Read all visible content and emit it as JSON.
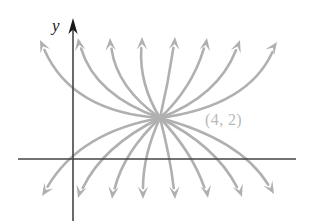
{
  "figure": {
    "kind": "phase-portrait",
    "background_color": "#ffffff",
    "width": 315,
    "height": 221
  },
  "axes": {
    "color": "#454545",
    "y_axis_label": "y",
    "x_axis_label": "",
    "origin": {
      "x": 73,
      "y": 159
    },
    "x_axis": {
      "x1": 18,
      "y1": 159,
      "x2": 296,
      "y2": 159
    },
    "y_axis": {
      "x": 73,
      "y_top": 18,
      "y_bottom": 221
    },
    "y_arrowhead_color": "#1a1a1a"
  },
  "annotations": [
    {
      "name": "equilibrium-point-label",
      "text": "(4, 2)",
      "x": 205,
      "y": 125,
      "color": "#b9b9b9"
    }
  ],
  "chart_data": {
    "type": "line",
    "title": "",
    "xlabel": "",
    "ylabel": "y",
    "grid": false,
    "legend": null,
    "curve_color": "#b0b0b0",
    "curve_width": 2.6,
    "node": {
      "x": 160,
      "y": 118,
      "label": "(4, 2)"
    },
    "upward_trajectories": [
      {
        "id": "up-1",
        "control_x": 72,
        "control_y": 112,
        "tip_x": 40,
        "tip_y": 40,
        "tip_angle": -115
      },
      {
        "id": "up-2",
        "control_x": 95,
        "control_y": 95,
        "tip_x": 78,
        "tip_y": 38,
        "tip_angle": -100
      },
      {
        "id": "up-3",
        "control_x": 117,
        "control_y": 88,
        "tip_x": 110,
        "tip_y": 38,
        "tip_angle": -93
      },
      {
        "id": "up-4",
        "control_x": 139,
        "control_y": 84,
        "tip_x": 142,
        "tip_y": 37,
        "tip_angle": -90
      },
      {
        "id": "up-5",
        "control_x": 168,
        "control_y": 84,
        "tip_x": 175,
        "tip_y": 37,
        "tip_angle": -86
      },
      {
        "id": "up-6",
        "control_x": 192,
        "control_y": 88,
        "tip_x": 207,
        "tip_y": 38,
        "tip_angle": -80
      },
      {
        "id": "up-7",
        "control_x": 218,
        "control_y": 96,
        "tip_x": 240,
        "tip_y": 40,
        "tip_angle": -70
      },
      {
        "id": "up-8",
        "control_x": 248,
        "control_y": 106,
        "tip_x": 277,
        "tip_y": 42,
        "tip_angle": -55
      }
    ],
    "downward_trajectories": [
      {
        "id": "down-1",
        "control_x": 80,
        "control_y": 132,
        "tip_x": 42,
        "tip_y": 196,
        "tip_angle": 123
      },
      {
        "id": "down-2",
        "control_x": 103,
        "control_y": 146,
        "tip_x": 78,
        "tip_y": 198,
        "tip_angle": 107
      },
      {
        "id": "down-3",
        "control_x": 124,
        "control_y": 152,
        "tip_x": 112,
        "tip_y": 199,
        "tip_angle": 97
      },
      {
        "id": "down-4",
        "control_x": 143,
        "control_y": 155,
        "tip_x": 143,
        "tip_y": 199,
        "tip_angle": 90
      },
      {
        "id": "down-5",
        "control_x": 170,
        "control_y": 156,
        "tip_x": 175,
        "tip_y": 199,
        "tip_angle": 87
      },
      {
        "id": "down-6",
        "control_x": 192,
        "control_y": 152,
        "tip_x": 208,
        "tip_y": 198,
        "tip_angle": 80
      },
      {
        "id": "down-7",
        "control_x": 216,
        "control_y": 146,
        "tip_x": 242,
        "tip_y": 197,
        "tip_angle": 70
      },
      {
        "id": "down-8",
        "control_x": 240,
        "control_y": 139,
        "tip_x": 274,
        "tip_y": 194,
        "tip_angle": 60
      }
    ]
  }
}
